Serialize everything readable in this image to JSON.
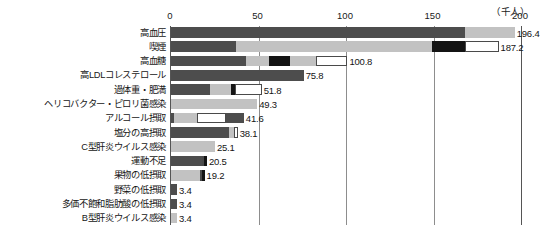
{
  "chart_data": {
    "type": "bar",
    "orientation": "horizontal",
    "stacked": true,
    "title": "",
    "subtitle": "",
    "unit_label": "（千人）",
    "xlabel": "",
    "ylabel": "",
    "xlim": [
      0,
      200
    ],
    "xticks": [
      0,
      50,
      100,
      150,
      200
    ],
    "xtick_labels": [
      "0",
      "50",
      "100",
      "150",
      "200"
    ],
    "grid": true,
    "grid_axis": "x",
    "legend": "none",
    "categories": [
      "高血圧",
      "喫煙",
      "高血糖",
      "高LDLコレステロール",
      "過体重・肥満",
      "ヘリコバクター・ピロリ菌感染",
      "アルコール摂取",
      "塩分の高摂取",
      "C型肝炎ウイルス感染",
      "運動不足",
      "果物の低摂取",
      "野菜の低摂取",
      "多価不飽和脂肪酸の低摂取",
      "B型肝炎ウイルス感染"
    ],
    "values": [
      196.4,
      187.2,
      100.8,
      75.8,
      51.8,
      49.3,
      41.6,
      38.1,
      25.1,
      20.5,
      19.2,
      3.4,
      3.4,
      3.4
    ],
    "value_labels": [
      "196.4",
      "187.2",
      "100.8",
      "75.8",
      "51.8",
      "49.3",
      "41.6",
      "38.1",
      "25.1",
      "20.5",
      "19.2",
      "3.4",
      "3.4",
      "3.4"
    ],
    "colors": {
      "dark": "#4d4d4d",
      "mid": "#c2c2c2",
      "black": "#141414",
      "white": "#ffffff",
      "axis": "#555555",
      "grid": "#8d8d8d",
      "text": "#141414"
    },
    "bars": [
      {
        "category": "高血圧",
        "total": 196.4,
        "segments": [
          {
            "style": "dark",
            "value": 168.0
          },
          {
            "style": "mid",
            "value": 28.4
          }
        ]
      },
      {
        "category": "喫煙",
        "total": 187.2,
        "segments": [
          {
            "style": "dark",
            "value": 37.0
          },
          {
            "style": "mid",
            "value": 112.0
          },
          {
            "style": "black",
            "value": 19.0
          },
          {
            "style": "white",
            "value": 19.2
          }
        ]
      },
      {
        "category": "高血糖",
        "total": 100.8,
        "segments": [
          {
            "style": "dark",
            "value": 43.0
          },
          {
            "style": "mid",
            "value": 13.0
          },
          {
            "style": "black",
            "value": 12.0
          },
          {
            "style": "mid",
            "value": 15.0
          },
          {
            "style": "white",
            "value": 17.8
          }
        ]
      },
      {
        "category": "高LDLコレステロール",
        "total": 75.8,
        "segments": [
          {
            "style": "dark",
            "value": 75.8
          }
        ]
      },
      {
        "category": "過体重・肥満",
        "total": 51.8,
        "segments": [
          {
            "style": "dark",
            "value": 22.0
          },
          {
            "style": "mid",
            "value": 12.0
          },
          {
            "style": "black",
            "value": 2.5
          },
          {
            "style": "white",
            "value": 15.3
          }
        ]
      },
      {
        "category": "ヘリコバクター・ピロリ菌感染",
        "total": 49.3,
        "segments": [
          {
            "style": "mid",
            "value": 49.3
          }
        ]
      },
      {
        "category": "アルコール摂取",
        "total": 41.6,
        "segments": [
          {
            "style": "dark",
            "value": 1.6
          },
          {
            "style": "mid",
            "value": 13.0
          },
          {
            "style": "white",
            "value": 17.0
          },
          {
            "style": "dark",
            "value": 10.0
          }
        ]
      },
      {
        "category": "塩分の高摂取",
        "total": 38.1,
        "segments": [
          {
            "style": "dark",
            "value": 33.0
          },
          {
            "style": "mid",
            "value": 3.0
          },
          {
            "style": "white",
            "value": 2.1
          }
        ]
      },
      {
        "category": "C型肝炎ウイルス感染",
        "total": 25.1,
        "segments": [
          {
            "style": "mid",
            "value": 25.1
          }
        ]
      },
      {
        "category": "運動不足",
        "total": 20.5,
        "segments": [
          {
            "style": "dark",
            "value": 17.5
          },
          {
            "style": "white",
            "value": 1.2
          },
          {
            "style": "black",
            "value": 1.8
          }
        ]
      },
      {
        "category": "果物の低摂取",
        "total": 19.2,
        "segments": [
          {
            "style": "mid",
            "value": 16.5
          },
          {
            "style": "white",
            "value": 1.0
          },
          {
            "style": "black",
            "value": 1.7
          }
        ]
      },
      {
        "category": "野菜の低摂取",
        "total": 3.4,
        "segments": [
          {
            "style": "dark",
            "value": 3.4
          }
        ]
      },
      {
        "category": "多価不飽和脂肪酸の低摂取",
        "total": 3.4,
        "segments": [
          {
            "style": "dark",
            "value": 3.4
          }
        ]
      },
      {
        "category": "B型肝炎ウイルス感染",
        "total": 3.4,
        "segments": [
          {
            "style": "mid",
            "value": 3.4
          }
        ]
      }
    ]
  }
}
